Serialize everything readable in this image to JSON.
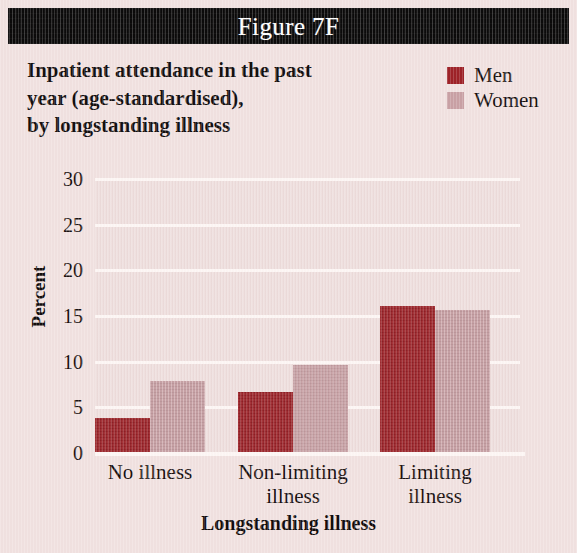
{
  "figure": {
    "banner_label": "Figure 7F",
    "title_lines": [
      "Inpatient attendance in the past",
      "year (age-standardised),",
      "by longstanding illness"
    ]
  },
  "legend": {
    "position": "top-right",
    "entries": [
      {
        "label": "Men",
        "color": "#9e2228"
      },
      {
        "label": "Women",
        "color": "#c9a1a5"
      }
    ]
  },
  "colors": {
    "banner_background": "#0b0a0a",
    "banner_text": "#ffffff",
    "page_background": "#f1e1e0",
    "plot_background": "#eedcdb",
    "gridline": "#fdf6f4",
    "men": "#9e2228",
    "women": "#c9a1a5",
    "text": "#1a1212"
  },
  "chart_data": {
    "type": "bar",
    "title": "Inpatient attendance in the past year (age-standardised), by longstanding illness",
    "xlabel": "Longstanding illness",
    "ylabel": "Percent",
    "categories": [
      "No illness",
      "Non-limiting illness",
      "Limiting illness"
    ],
    "category_lines": [
      [
        "No illness"
      ],
      [
        "Non-limiting",
        "illness"
      ],
      [
        "Limiting",
        "illness"
      ]
    ],
    "series": [
      {
        "name": "Men",
        "color": "#9e2228",
        "values": [
          3.8,
          6.7,
          16.1
        ]
      },
      {
        "name": "Women",
        "color": "#c9a1a5",
        "values": [
          7.9,
          9.6,
          15.7
        ]
      }
    ],
    "ylim": [
      0,
      30
    ],
    "yticks": [
      0,
      5,
      10,
      15,
      20,
      25,
      30
    ],
    "ytick_labels": [
      "0",
      "5",
      "10",
      "15",
      "20",
      "25",
      "30"
    ],
    "grid": true,
    "grid_axis": "y",
    "legend": true,
    "legend_position": "top-right"
  }
}
